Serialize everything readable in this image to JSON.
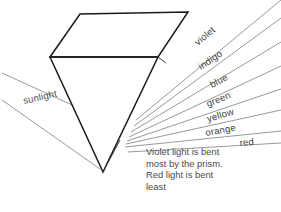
{
  "diagram": {
    "type": "optics-ray-diagram",
    "background_color": "#ffffff",
    "ink_color": "#1a1a1a",
    "ray_color": "#8c8c8c",
    "text_color": "#4a4a4a"
  },
  "prism": {
    "name": "triangular-prism",
    "top_face_points": "50,57 80,14 188,12 158,57",
    "front_face_points": "50,57 158,57 103,172",
    "right_face_points": "158,57 188,12 188,27 166,63",
    "apex_inner_line": "120,140 103,172",
    "right_inner_line": "158,57 166,63"
  },
  "incident_beam": {
    "label": "sunlight",
    "label_x": 24,
    "label_y": 104,
    "label_rotation": -13,
    "upper_line": "2,73 92,114",
    "lower_line": "2,100 100,169"
  },
  "spectrum": {
    "origin_x": 125,
    "origin_y": 145,
    "rays": [
      {
        "label": "violet",
        "x1": 136,
        "y1": 120,
        "x2": 281,
        "y2": 0,
        "label_x": 198,
        "label_y": 46,
        "label_rotation": -40
      },
      {
        "label": "indigo",
        "x1": 134,
        "y1": 126,
        "x2": 281,
        "y2": 18,
        "label_x": 201,
        "label_y": 70,
        "label_rotation": -34
      },
      {
        "label": "blue",
        "x1": 131,
        "y1": 132,
        "x2": 281,
        "y2": 42,
        "label_x": 212,
        "label_y": 88,
        "label_rotation": -28
      },
      {
        "label": "green",
        "x1": 129,
        "y1": 137,
        "x2": 281,
        "y2": 66,
        "label_x": 208,
        "label_y": 107,
        "label_rotation": -22
      },
      {
        "label": "yellow",
        "x1": 127,
        "y1": 141,
        "x2": 281,
        "y2": 89,
        "label_x": 208,
        "label_y": 122,
        "label_rotation": -16
      },
      {
        "label": "orange",
        "x1": 126,
        "y1": 144,
        "x2": 281,
        "y2": 110,
        "label_x": 206,
        "label_y": 136,
        "label_rotation": -10
      },
      {
        "label": "red",
        "x1": 125,
        "y1": 147,
        "x2": 281,
        "y2": 131,
        "label_x": 240,
        "label_y": 146,
        "label_rotation": -5
      }
    ],
    "baseline": "128,152 281,143"
  },
  "caption": {
    "lines": [
      "Violet light is bent",
      "most by the prism.",
      "Red light is bent",
      "least"
    ]
  }
}
